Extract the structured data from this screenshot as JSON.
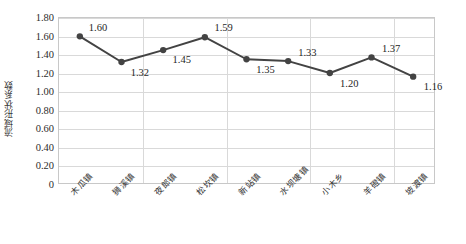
{
  "chart_data": {
    "type": "line",
    "title": "",
    "xlabel": "",
    "ylabel": "流域形状系数",
    "ylim": [
      0,
      1.8
    ],
    "ytick_labels": [
      "1.80",
      "1.60",
      "1.40",
      "1.20",
      "1.00",
      "0.80",
      "0.60",
      "0.40",
      "0.20",
      "0"
    ],
    "ytick_values": [
      1.8,
      1.6,
      1.4,
      1.2,
      1.0,
      0.8,
      0.6,
      0.4,
      0.2,
      0
    ],
    "categories": [
      "木瓜镇",
      "狮溪镇",
      "夜郎镇",
      "松坎镇",
      "新站镇",
      "水坝塘镇",
      "小木乡",
      "羊磴镇",
      "坡渡镇"
    ],
    "values": [
      1.6,
      1.32,
      1.45,
      1.59,
      1.35,
      1.33,
      1.2,
      1.37,
      1.16
    ],
    "point_labels": [
      "1.60",
      "1.32",
      "1.45",
      "1.59",
      "1.35",
      "1.33",
      "1.20",
      "1.37",
      "1.16"
    ],
    "label_positions": [
      "above-right",
      "below-right",
      "below-right",
      "above-right",
      "below-right",
      "above-right",
      "below-right",
      "above-right",
      "below-right"
    ],
    "grid": {
      "horizontal": true,
      "vertical": true,
      "vertical_every": 2
    },
    "legend": {
      "show": false,
      "position": "none"
    },
    "series_color": "#434343",
    "marker": "circle",
    "marker_color": "#434343",
    "grid_color": "#d9d9d9",
    "axis_border_color": "#c8c8c8",
    "text_color": "#1f1f1f"
  }
}
